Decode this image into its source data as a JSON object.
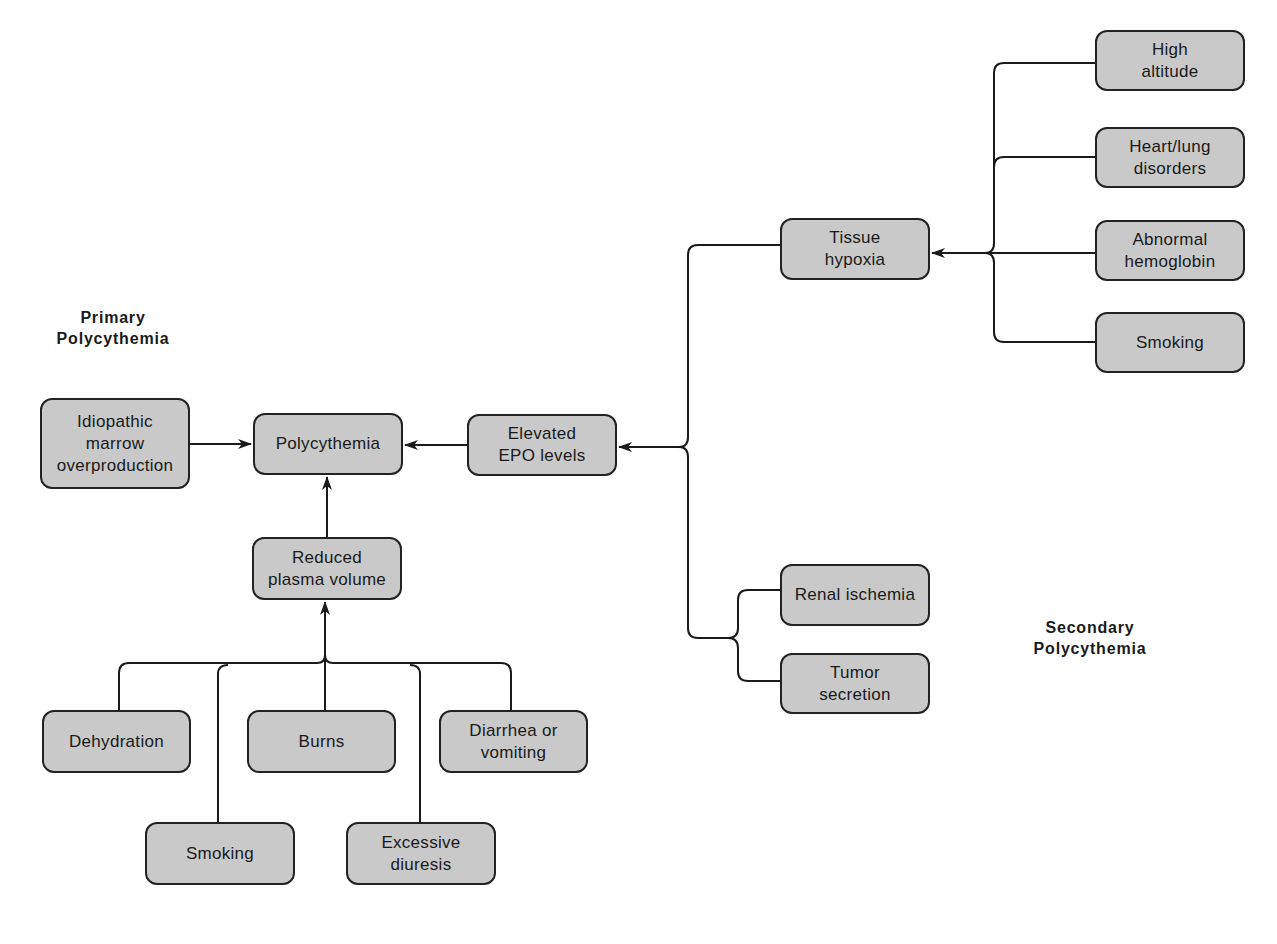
{
  "labels": {
    "primary": "Primary\nPolycythemia",
    "secondary": "Secondary\nPolycythemia"
  },
  "nodes": {
    "polycythemia": "Polycythemia",
    "idiopathic": "Idiopathic\nmarrow\noverproduction",
    "elevated_epo": "Elevated\nEPO levels",
    "tissue_hypoxia": "Tissue\nhypoxia",
    "high_altitude": "High\naltitude",
    "heart_lung": "Heart/lung\ndisorders",
    "abnormal_hemoglobin": "Abnormal\nhemoglobin",
    "smoking_secondary": "Smoking",
    "renal_ischemia": "Renal ischemia",
    "tumor_secretion": "Tumor\nsecretion",
    "reduced_plasma": "Reduced\nplasma volume",
    "dehydration": "Dehydration",
    "burns": "Burns",
    "diarrhea": "Diarrhea or\nvomiting",
    "smoking_primary": "Smoking",
    "excessive_diuresis": "Excessive\ndiuresis"
  },
  "edges": [
    {
      "from": "Idiopathic marrow overproduction",
      "to": "Polycythemia"
    },
    {
      "from": "Elevated EPO levels",
      "to": "Polycythemia"
    },
    {
      "from": "Reduced plasma volume",
      "to": "Polycythemia"
    },
    {
      "from": "Tissue hypoxia",
      "to": "Elevated EPO levels"
    },
    {
      "from": "Renal ischemia",
      "to": "Elevated EPO levels"
    },
    {
      "from": "Tumor secretion",
      "to": "Elevated EPO levels"
    },
    {
      "from": "High altitude",
      "to": "Tissue hypoxia"
    },
    {
      "from": "Heart/lung disorders",
      "to": "Tissue hypoxia"
    },
    {
      "from": "Abnormal hemoglobin",
      "to": "Tissue hypoxia"
    },
    {
      "from": "Smoking",
      "to": "Tissue hypoxia"
    },
    {
      "from": "Dehydration",
      "to": "Reduced plasma volume"
    },
    {
      "from": "Burns",
      "to": "Reduced plasma volume"
    },
    {
      "from": "Diarrhea or vomiting",
      "to": "Reduced plasma volume"
    },
    {
      "from": "Smoking",
      "to": "Reduced plasma volume"
    },
    {
      "from": "Excessive diuresis",
      "to": "Reduced plasma volume"
    }
  ],
  "colors": {
    "node_fill": "#c9c9c9",
    "node_border": "#222222",
    "line": "#1a1a1a",
    "background": "#ffffff"
  }
}
